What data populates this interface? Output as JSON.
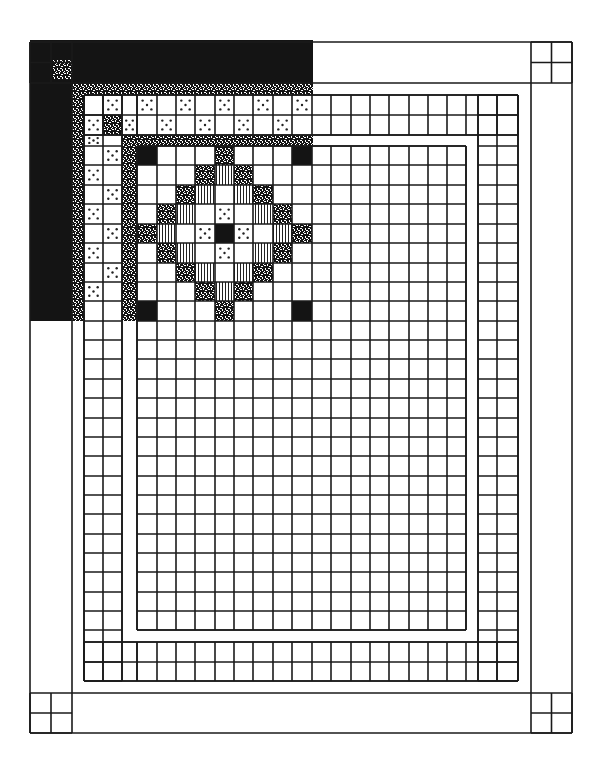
{
  "colors": {
    "line": "#1a1a1a",
    "dark": "#141414",
    "fill": "#ffffff"
  },
  "legend": {
    "D": "solid-dark",
    "S": "speckled",
    "V": "vertical-stripes",
    "P": "dotted",
    ".": "plain"
  },
  "layout": {
    "outer": {
      "x0": 30,
      "y0": 42,
      "x1": 572,
      "y1": 733
    },
    "border_width": 41,
    "strip_width": 12,
    "shaded_region": {
      "x0": 30,
      "y0": 40,
      "x1": 313,
      "y1": 321
    },
    "field_cols": [
      137,
      157,
      176,
      195,
      215,
      234,
      253,
      273,
      292,
      312,
      331,
      351,
      370,
      389,
      409,
      428,
      447,
      466
    ],
    "field_rows": [
      146,
      165,
      185,
      204,
      224,
      243,
      263,
      282,
      301,
      321,
      340,
      359,
      379,
      398,
      418,
      437,
      456,
      476,
      495,
      514,
      534,
      553,
      572,
      592,
      611,
      630
    ],
    "left_border_cols": [
      84,
      103,
      122
    ],
    "right_border_cols": [
      478,
      497,
      518
    ],
    "top_border_rows": [
      95,
      115,
      135
    ],
    "bottom_border_rows": [
      642,
      662,
      681
    ],
    "inner_strip": {
      "x0": 72,
      "y0": 83,
      "x1": 531,
      "y1": 693
    },
    "sashing": {
      "x0": 122,
      "y0": 135,
      "x1": 478,
      "y1": 642
    }
  },
  "medallion": {
    "rows": [
      "D...S...D",
      "...SVS...",
      "..SV.VS..",
      ".SV.P.VS.",
      "SV.PDP.VS",
      ".SV.P.VS.",
      "..SV.VS..",
      "...SVS...",
      "D...S...D"
    ]
  },
  "top_checker": {
    "row_a": [
      ".",
      "P",
      ".",
      "P",
      ".",
      "P",
      ".",
      "P",
      ".",
      "P",
      ".",
      "P"
    ],
    "row_b": [
      "P",
      "S",
      "P",
      ".",
      "P",
      ".",
      "P",
      ".",
      "P",
      ".",
      "P",
      "."
    ]
  },
  "left_checker": {
    "col_a": [
      "P",
      ".",
      "P",
      ".",
      "P",
      ".",
      "P",
      ".",
      "P"
    ],
    "col_b": [
      ".",
      "P",
      ".",
      "P",
      ".",
      "P",
      ".",
      "P",
      "."
    ]
  }
}
